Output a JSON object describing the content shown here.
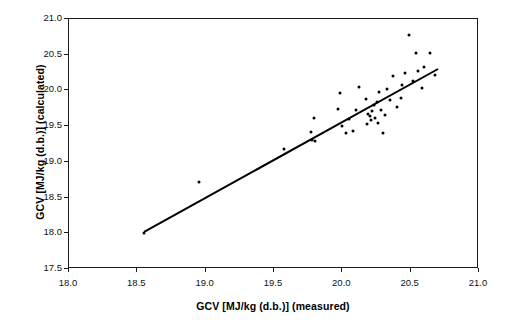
{
  "chart_data": {
    "type": "scatter",
    "title": "",
    "xlabel": "GCV [MJ/kg (d.b.)] (measured)",
    "ylabel": "GCV [MJ/kg (d.b.)] (calculated)",
    "xlim": [
      18.0,
      21.0
    ],
    "ylim": [
      17.5,
      21.0
    ],
    "xticks": [
      "18.0",
      "18.5",
      "19.0",
      "19.5",
      "20.0",
      "20.5",
      "21.0"
    ],
    "yticks": [
      "17.5",
      "18.0",
      "18.5",
      "19.0",
      "19.5",
      "20.0",
      "20.5",
      "21.0"
    ],
    "xtick_values": [
      18.0,
      18.5,
      19.0,
      19.5,
      20.0,
      20.5,
      21.0
    ],
    "ytick_values": [
      17.5,
      18.0,
      18.5,
      19.0,
      19.5,
      20.0,
      20.5,
      21.0
    ],
    "grid": false,
    "legend": false,
    "marker_color": "#000000",
    "marker_size": 3,
    "frame_color": "#1a1a1a",
    "series": [
      {
        "name": "samples",
        "type": "scatter",
        "points": [
          [
            18.55,
            18.01
          ],
          [
            18.95,
            18.72
          ],
          [
            19.57,
            19.18
          ],
          [
            19.77,
            19.42
          ],
          [
            19.78,
            19.3
          ],
          [
            19.8,
            19.29
          ],
          [
            19.79,
            19.62
          ],
          [
            19.97,
            19.74
          ],
          [
            19.98,
            19.97
          ],
          [
            20.0,
            19.5
          ],
          [
            20.03,
            19.41
          ],
          [
            20.05,
            19.6
          ],
          [
            20.08,
            19.43
          ],
          [
            20.1,
            19.72
          ],
          [
            20.12,
            20.05
          ],
          [
            20.17,
            19.88
          ],
          [
            20.18,
            19.53
          ],
          [
            20.19,
            19.67
          ],
          [
            20.2,
            19.64
          ],
          [
            20.21,
            19.58
          ],
          [
            20.22,
            19.71
          ],
          [
            20.23,
            19.79
          ],
          [
            20.24,
            19.62
          ],
          [
            20.25,
            19.84
          ],
          [
            20.26,
            19.55
          ],
          [
            20.27,
            19.98
          ],
          [
            20.28,
            19.73
          ],
          [
            20.3,
            19.41
          ],
          [
            20.31,
            19.65
          ],
          [
            20.33,
            20.02
          ],
          [
            20.35,
            19.86
          ],
          [
            20.37,
            20.2
          ],
          [
            20.4,
            19.77
          ],
          [
            20.43,
            19.9
          ],
          [
            20.44,
            20.08
          ],
          [
            20.46,
            20.25
          ],
          [
            20.49,
            20.78
          ],
          [
            20.52,
            20.13
          ],
          [
            20.54,
            20.52
          ],
          [
            20.55,
            20.27
          ],
          [
            20.58,
            20.04
          ],
          [
            20.6,
            20.33
          ],
          [
            20.64,
            20.53
          ],
          [
            20.68,
            20.22
          ]
        ]
      },
      {
        "name": "regression-line",
        "type": "line",
        "x_start": 18.55,
        "y_start": 18.02,
        "x_end": 20.7,
        "y_end": 20.3,
        "color": "#000000",
        "width": 2
      }
    ]
  },
  "axes": {
    "x_title": "GCV [MJ/kg (d.b.)] (measured)",
    "y_title": "GCV [MJ/kg (d.b.)] (calculated)"
  }
}
